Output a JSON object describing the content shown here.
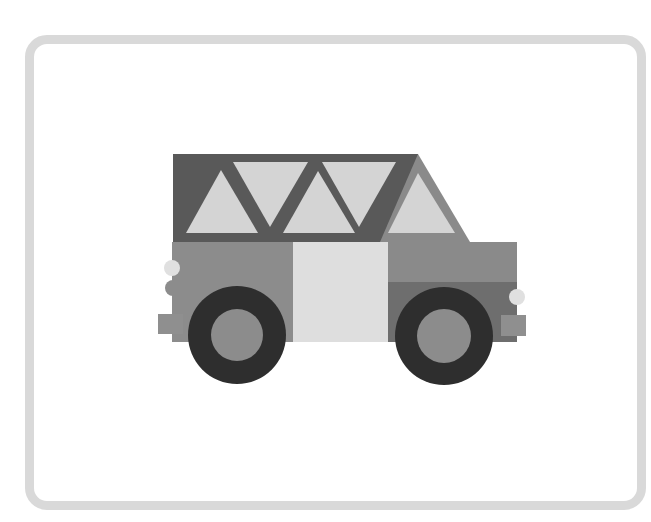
{
  "image": {
    "description": "Flat grayscale illustration of an off-road jeep/car inside a rounded frame",
    "subject": "car",
    "colors": {
      "frame": "#d9d9d9",
      "background": "#ffffff",
      "roof_dark": "#595959",
      "roof_accent": "#8a8a8a",
      "window_light": "#d4d4d4",
      "body": "#8c8c8c",
      "body_dark": "#6e6e6e",
      "door": "#dedede",
      "tire": "#2e2e2e",
      "hub": "#8c8c8c",
      "headlight": "#e0e0e0",
      "bumper": "#8f8f8f"
    }
  }
}
